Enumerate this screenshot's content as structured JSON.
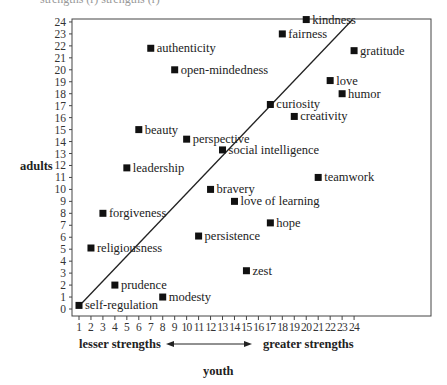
{
  "caption_fragment": "strengths   (r)   strengths (r)",
  "chart_data": {
    "type": "scatter",
    "title": "",
    "xlabel": "youth",
    "ylabel": "adults",
    "x_scale_note": {
      "left": "lesser strengths",
      "right": "greater strengths"
    },
    "xlim": [
      1,
      24
    ],
    "ylim": [
      0,
      24
    ],
    "x_ticks": [
      1,
      2,
      3,
      4,
      5,
      6,
      7,
      8,
      9,
      10,
      11,
      12,
      13,
      14,
      15,
      16,
      17,
      18,
      19,
      20,
      21,
      22,
      23,
      24
    ],
    "y_ticks": [
      0,
      1,
      2,
      3,
      4,
      5,
      6,
      7,
      8,
      9,
      10,
      11,
      12,
      13,
      14,
      15,
      16,
      17,
      18,
      19,
      20,
      21,
      22,
      23,
      24
    ],
    "grid": false,
    "reference_line": {
      "from": [
        1,
        0
      ],
      "to": [
        24,
        24
      ],
      "label": "identity diagonal"
    },
    "points": [
      {
        "label": "kindness",
        "x": 20,
        "y": 24.2
      },
      {
        "label": "fairness",
        "x": 18,
        "y": 23
      },
      {
        "label": "gratitude",
        "x": 24,
        "y": 21.6
      },
      {
        "label": "authenticity",
        "x": 7,
        "y": 21.8
      },
      {
        "label": "open-mindedness",
        "x": 9,
        "y": 20
      },
      {
        "label": "love",
        "x": 22,
        "y": 19.1
      },
      {
        "label": "humor",
        "x": 23,
        "y": 18
      },
      {
        "label": "curiosity",
        "x": 17,
        "y": 17.1
      },
      {
        "label": "creativity",
        "x": 19,
        "y": 16.1
      },
      {
        "label": "beauty",
        "x": 6,
        "y": 15
      },
      {
        "label": "perspective",
        "x": 10,
        "y": 14.2
      },
      {
        "label": "social intelligence",
        "x": 13,
        "y": 13.3
      },
      {
        "label": "leadership",
        "x": 5,
        "y": 11.8
      },
      {
        "label": "teamwork",
        "x": 21,
        "y": 11
      },
      {
        "label": "bravery",
        "x": 12,
        "y": 10
      },
      {
        "label": "love of learning",
        "x": 14,
        "y": 9
      },
      {
        "label": "forgiveness",
        "x": 3,
        "y": 8
      },
      {
        "label": "hope",
        "x": 17,
        "y": 7.2
      },
      {
        "label": "persistence",
        "x": 11,
        "y": 6.1
      },
      {
        "label": "religiousness",
        "x": 2,
        "y": 5.1
      },
      {
        "label": "zest",
        "x": 15,
        "y": 3.2
      },
      {
        "label": "prudence",
        "x": 4,
        "y": 2
      },
      {
        "label": "modesty",
        "x": 8,
        "y": 1
      },
      {
        "label": "self-regulation",
        "x": 1,
        "y": 0.3
      }
    ]
  }
}
